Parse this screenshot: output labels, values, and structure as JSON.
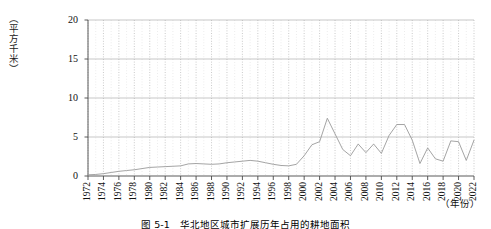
{
  "figure": {
    "caption": "图 5-1　华北地区城市扩展历年占用的耕地面积",
    "y_axis_unit": "（平方千米）",
    "x_axis_unit": "（年份）"
  },
  "chart_data": {
    "type": "line",
    "title": "图 5-1　华北地区城市扩展历年占用的耕地面积",
    "xlabel": "（年份）",
    "ylabel": "（平方千米）",
    "xlim": [
      1972,
      2022
    ],
    "ylim": [
      0,
      20
    ],
    "ytick_labels": [
      "0",
      "5",
      "10",
      "15",
      "20"
    ],
    "yticks": [
      0,
      5,
      10,
      15,
      20
    ],
    "xtick_labels": [
      "1972",
      "1974",
      "1976",
      "1978",
      "1980",
      "1982",
      "1984",
      "1986",
      "1988",
      "1990",
      "1992",
      "1994",
      "1996",
      "1998",
      "2000",
      "2002",
      "2004",
      "2006",
      "2008",
      "2010",
      "2012",
      "2014",
      "2016",
      "2018",
      "2020",
      "2022"
    ],
    "xticks": [
      1972,
      1974,
      1976,
      1978,
      1980,
      1982,
      1984,
      1986,
      1988,
      1990,
      1992,
      1994,
      1996,
      1998,
      2000,
      2002,
      2004,
      2006,
      2008,
      2010,
      2012,
      2014,
      2016,
      2018,
      2020,
      2022
    ],
    "grid": true,
    "grid_style": "dotted vertical at every year, horizontal at major ticks",
    "legend": false,
    "line_color": "#9a9a9a",
    "x": [
      1972,
      1973,
      1974,
      1975,
      1976,
      1977,
      1978,
      1979,
      1980,
      1981,
      1982,
      1983,
      1984,
      1985,
      1986,
      1987,
      1988,
      1989,
      1990,
      1991,
      1992,
      1993,
      1994,
      1995,
      1996,
      1997,
      1998,
      1999,
      2000,
      2001,
      2002,
      2003,
      2004,
      2005,
      2006,
      2007,
      2008,
      2009,
      2010,
      2011,
      2012,
      2013,
      2014,
      2015,
      2016,
      2017,
      2018,
      2019,
      2020,
      2021,
      2022
    ],
    "values": [
      0.15,
      0.2,
      0.3,
      0.45,
      0.6,
      0.7,
      0.8,
      0.95,
      1.1,
      1.15,
      1.2,
      1.25,
      1.3,
      1.55,
      1.6,
      1.55,
      1.5,
      1.55,
      1.7,
      1.8,
      1.9,
      2.0,
      1.9,
      1.7,
      1.5,
      1.35,
      1.3,
      1.5,
      2.6,
      4.0,
      4.4,
      7.4,
      5.4,
      3.4,
      2.6,
      4.1,
      3.0,
      4.1,
      2.9,
      5.2,
      6.6,
      6.6,
      4.6,
      1.6,
      3.6,
      2.2,
      1.9,
      4.5,
      4.4,
      2.0,
      4.6
    ],
    "series_name": "耕地占用面积"
  }
}
